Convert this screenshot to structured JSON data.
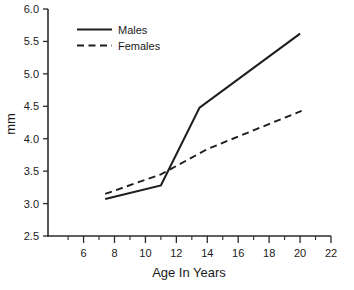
{
  "chart_data": {
    "type": "line",
    "title": "",
    "xlabel": "Age In Years",
    "ylabel": "mm",
    "xlim": [
      3.7,
      22
    ],
    "ylim": [
      2.5,
      6.0
    ],
    "grid": false,
    "legend_position": "top-left",
    "x_ticks_major": [
      6,
      8,
      10,
      12,
      14,
      16,
      18,
      20,
      22
    ],
    "x_tick_labels": [
      "6",
      "8",
      "10",
      "12",
      "14",
      "16",
      "18",
      "20",
      "22"
    ],
    "x_ticks_minor": [
      5,
      7,
      9,
      11,
      13,
      15,
      17,
      19,
      21
    ],
    "y_ticks": [
      2.5,
      3.0,
      3.5,
      4.0,
      4.5,
      5.0,
      5.5,
      6.0
    ],
    "y_tick_labels": [
      "2.5",
      "3.0",
      "3.5",
      "4.0",
      "4.5",
      "5.0",
      "5.5",
      "6.0"
    ],
    "series": [
      {
        "name": "Males",
        "style": "solid",
        "color": "#1e1e1e",
        "x": [
          7.4,
          11.0,
          13.5,
          20.0
        ],
        "y": [
          3.07,
          3.28,
          4.48,
          5.62
        ]
      },
      {
        "name": "Females",
        "style": "dashed",
        "color": "#1e1e1e",
        "x": [
          7.4,
          11.0,
          14.0,
          20.1
        ],
        "y": [
          3.15,
          3.45,
          3.84,
          4.43
        ]
      }
    ]
  },
  "legend": {
    "entries": [
      {
        "label": "Males",
        "style": "solid"
      },
      {
        "label": "Females",
        "style": "dashed"
      }
    ]
  },
  "axes": {
    "x_title": "Age In Years",
    "y_title": "mm"
  }
}
